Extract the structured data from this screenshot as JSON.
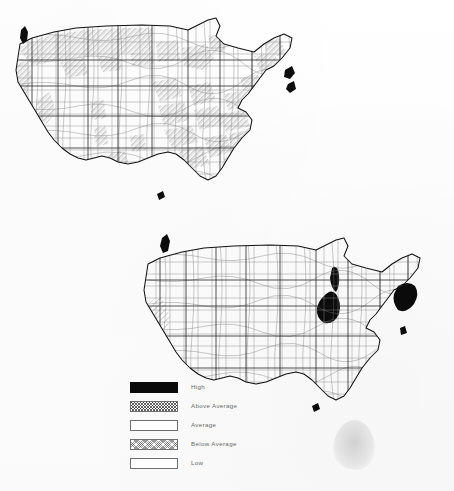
{
  "figure": {
    "kind": "two-panel choropleth map figure",
    "background_color": "#fdfdfd",
    "ink_color": "#111111"
  },
  "maps": [
    {
      "id": "upper",
      "name": "upper-us-county-map",
      "region": "Contiguous United States, county level",
      "description": "Many counties shaded with the Above Average hatch pattern, concentrated in the Pacific Northwest, northern Plains, Great Lakes, Appalachia, the Southeast and New England; scattered solid black High counties near Seattle, Chicago, New York and the Gulf Coast.",
      "dominant_class": "Above Average"
    },
    {
      "id": "lower",
      "name": "lower-us-county-map",
      "region": "Contiguous United States, county level",
      "description": "Nearly all counties unshaded (Average / Low); solid black High clusters around Chicago, New York-New Jersey and Seattle, with Above Average hatching in California's Central Valley, coastal New Jersey and eastern Massachusetts.",
      "dominant_class": "Average"
    }
  ],
  "legend": {
    "name": "map-classification-legend",
    "items": [
      {
        "label": "High",
        "pattern": "solid-black",
        "color": "#0a0a0a"
      },
      {
        "label": "Above Average",
        "pattern": "cross-hatch",
        "color": "#ffffff"
      },
      {
        "label": "Average",
        "pattern": "blank",
        "color": "#ffffff"
      },
      {
        "label": "Below Average",
        "pattern": "fine-hatch",
        "color": "#ffffff"
      },
      {
        "label": "Low",
        "pattern": "blank",
        "color": "#ffffff"
      }
    ]
  },
  "artifacts": {
    "scan_blob": "faint gray scanner smudge lower right"
  }
}
